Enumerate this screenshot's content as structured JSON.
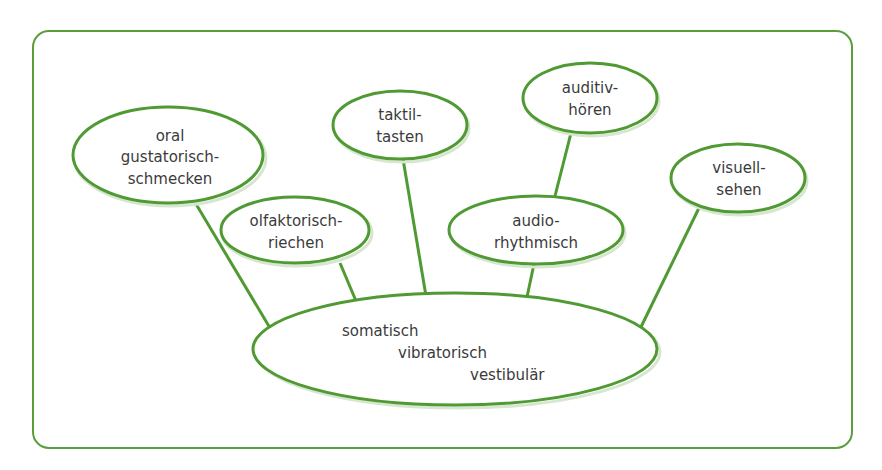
{
  "diagram": {
    "frame_color": "#5a9e3c",
    "node_stroke_color": "#4f9a33",
    "center": {
      "lines": [
        "somatisch",
        "vibratorisch",
        "vestibulär"
      ]
    },
    "nodes": [
      {
        "id": "oral",
        "lines": [
          "oral",
          "gustatorisch-",
          "schmecken"
        ]
      },
      {
        "id": "olfaktorisch",
        "lines": [
          "olfaktorisch-",
          "riechen"
        ]
      },
      {
        "id": "taktil",
        "lines": [
          "taktil-",
          "tasten"
        ]
      },
      {
        "id": "audio",
        "lines": [
          "audio-",
          "rhythmisch"
        ]
      },
      {
        "id": "auditiv",
        "lines": [
          "auditiv-",
          "hören"
        ]
      },
      {
        "id": "visuell",
        "lines": [
          "visuell-",
          "sehen"
        ]
      }
    ]
  }
}
